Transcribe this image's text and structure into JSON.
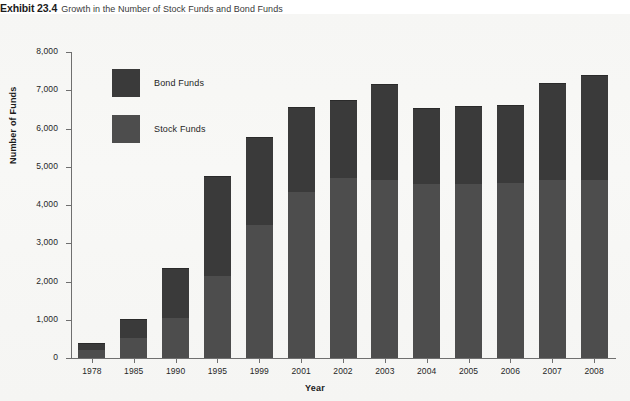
{
  "caption": {
    "label": "Exhibit 23.4",
    "text": "Growth in the Number of Stock Funds and Bond Funds"
  },
  "legend": {
    "position": "inside-top-left",
    "entries": [
      {
        "label": "Bond Funds",
        "color": "#3a3a3a",
        "swatch_name": "legend-swatch-bond"
      },
      {
        "label": "Stock Funds",
        "color": "#4d4d4d",
        "swatch_name": "legend-swatch-stock"
      }
    ]
  },
  "chart_data": {
    "type": "bar",
    "stacked": true,
    "title": "Growth in the Number of Stock Funds and Bond Funds",
    "xlabel": "Year",
    "ylabel": "Number of Funds",
    "ylim": [
      0,
      8000
    ],
    "ytick_step": 1000,
    "yticks": [
      0,
      1000,
      2000,
      3000,
      4000,
      5000,
      6000,
      7000,
      8000
    ],
    "ytick_labels": [
      "0",
      "1,000",
      "2,000",
      "3,000",
      "4,000",
      "5,000",
      "6,000",
      "7,000",
      "8,000"
    ],
    "grid": false,
    "categories": [
      "1978",
      "1985",
      "1990",
      "1995",
      "1999",
      "2001",
      "2002",
      "2003",
      "2004",
      "2005",
      "2006",
      "2007",
      "2008"
    ],
    "series": [
      {
        "name": "Stock Funds",
        "color": "#4d4d4d",
        "values": [
          200,
          530,
          1050,
          2140,
          3480,
          4340,
          4700,
          4660,
          4540,
          4560,
          4580,
          4660,
          4660
        ]
      },
      {
        "name": "Bond Funds",
        "color": "#3a3a3a",
        "values": [
          200,
          490,
          1300,
          2620,
          2300,
          2230,
          2050,
          2510,
          2000,
          2040,
          2040,
          2540,
          2740
        ]
      }
    ],
    "totals": [
      400,
      1020,
      2350,
      4760,
      5780,
      6570,
      6750,
      7170,
      6540,
      6600,
      6620,
      7200,
      7400
    ]
  }
}
